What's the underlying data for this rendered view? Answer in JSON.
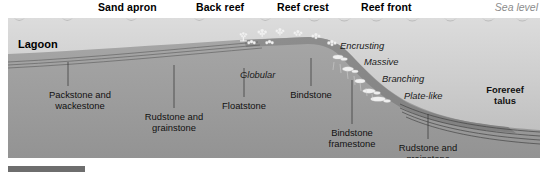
{
  "figure": {
    "type": "geological-cross-section"
  },
  "top_labels": [
    {
      "text": "Sand apron",
      "x": 98
    },
    {
      "text": "Back reef",
      "x": 196
    },
    {
      "text": "Reef crest",
      "x": 277
    },
    {
      "text": "Reef front",
      "x": 361
    }
  ],
  "sea_level_label": "Sea level",
  "lagoon_label": "Lagoon",
  "growth_forms": [
    {
      "text": "Encrusting",
      "x": 344,
      "y": 22
    },
    {
      "text": "Massive",
      "x": 366,
      "y": 38
    },
    {
      "text": "Branching",
      "x": 383,
      "y": 55
    },
    {
      "text": "Plate-like",
      "x": 404,
      "y": 72
    },
    {
      "text": "Globular",
      "x": 243,
      "y": 51
    }
  ],
  "facies_labels": [
    {
      "text": "Packstone and\nwackestone",
      "x": 22,
      "y": 71,
      "w": 100,
      "leader_x": 60,
      "leader_top": 44,
      "leader_bottom": 68
    },
    {
      "text": "Rudstone and\ngrainstone",
      "x": 118,
      "y": 93,
      "w": 96,
      "leader_x": 166,
      "leader_top": 47,
      "leader_bottom": 90
    },
    {
      "text": "Floatstone",
      "x": 196,
      "y": 82,
      "w": 80,
      "leader_x": 236,
      "leader_top": 50,
      "leader_bottom": 79
    },
    {
      "text": "Bindstone",
      "x": 265,
      "y": 71,
      "w": 76,
      "leader_x": 303,
      "leader_top": 40,
      "leader_bottom": 68
    },
    {
      "text": "Bindstone\nframestone",
      "x": 300,
      "y": 109,
      "w": 88,
      "leader_x": 344,
      "leader_top": 62,
      "leader_bottom": 106
    },
    {
      "text": "Rudstone and\ngrainstone",
      "x": 372,
      "y": 124,
      "w": 96,
      "leader_x": 420,
      "leader_top": 96,
      "leader_bottom": 121
    }
  ],
  "forereef_label": {
    "text": "Forereef\ntalus",
    "x": 458,
    "y": 66,
    "w": 78
  },
  "colors": {
    "water_top": "#d8d8d8",
    "water_bottom": "#bdbdbd",
    "rock_fill": "#9d9d9d",
    "reef_body": "#8a8a8a",
    "coral_white": "#f2f2f2",
    "label_text": "#111111",
    "sea_level_text": "#8c8c8c",
    "scalebar": "#6e6e6e"
  }
}
